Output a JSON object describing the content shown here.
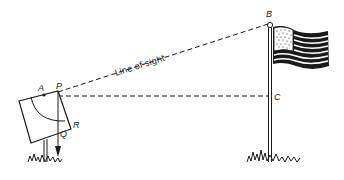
{
  "diagram": {
    "labels": {
      "A": "A",
      "P": "P",
      "Q": "Q",
      "R": "R",
      "B": "B",
      "C": "C",
      "line_of_sight": "Line of sight"
    },
    "colors": {
      "ink": "#1a1a1a",
      "background": "#ffffff"
    },
    "points": {
      "P": [
        58,
        92
      ],
      "A": [
        44,
        95
      ],
      "B": [
        270,
        24
      ],
      "C": [
        270,
        96
      ],
      "Q": [
        58,
        133
      ],
      "R": [
        70,
        125
      ]
    }
  }
}
